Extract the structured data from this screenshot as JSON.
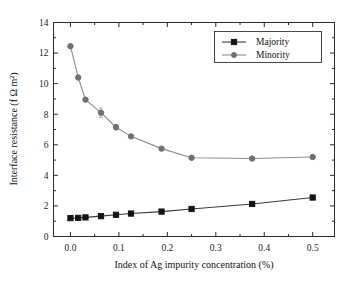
{
  "chart_data": {
    "type": "line",
    "title": "",
    "xlabel": "Index of Ag impurity concentration (%)",
    "ylabel": "Interface resistance (f Ω m²)",
    "xlim": [
      -0.035,
      0.545
    ],
    "ylim": [
      0,
      14
    ],
    "xticks": [
      0.0,
      0.1,
      0.2,
      0.3,
      0.4,
      0.5
    ],
    "xticklabels": [
      "0.0",
      "0.1",
      "0.2",
      "0.3",
      "0.4",
      "0.5"
    ],
    "yticks": [
      0,
      2,
      4,
      6,
      8,
      10,
      12,
      14
    ],
    "yticklabels": [
      "0",
      "2",
      "4",
      "6",
      "8",
      "10",
      "12",
      "14"
    ],
    "grid": false,
    "legend_position": "upper right",
    "series": [
      {
        "name": "Majority",
        "marker": "square",
        "color": "#141414",
        "x": [
          0.0,
          0.016,
          0.031,
          0.063,
          0.094,
          0.125,
          0.188,
          0.25,
          0.375,
          0.5
        ],
        "values": [
          1.2,
          1.22,
          1.25,
          1.33,
          1.42,
          1.5,
          1.63,
          1.8,
          2.13,
          2.55
        ]
      },
      {
        "name": "Minority",
        "marker": "circle",
        "color": "#707070",
        "x": [
          0.0,
          0.016,
          0.031,
          0.063,
          0.094,
          0.125,
          0.188,
          0.25,
          0.375,
          0.5
        ],
        "values": [
          12.45,
          10.4,
          8.95,
          8.1,
          7.15,
          6.55,
          5.75,
          5.15,
          5.1,
          5.2
        ],
        "yerr": [
          0.0,
          0.0,
          0.1,
          0.3,
          0.18,
          0.1,
          0.1,
          0.1,
          0.1,
          0.1
        ]
      }
    ]
  },
  "legend": {
    "entries": [
      {
        "label": "Majority"
      },
      {
        "label": "Minority"
      }
    ]
  },
  "axes": {
    "x_title": "Index of Ag impurity concentration (%)",
    "y_title": "Interface resistance (f Ω m²)"
  }
}
